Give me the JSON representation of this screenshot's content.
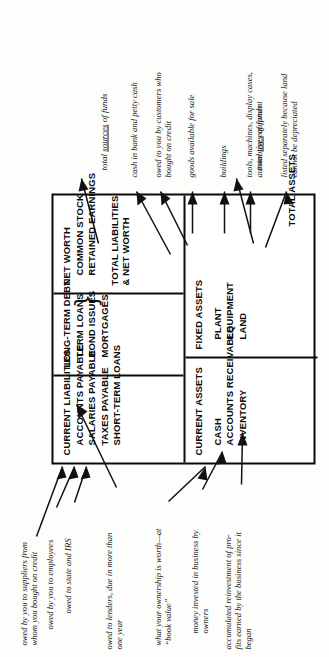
{
  "diagram": {
    "orientation": "rotated-90-ccw"
  },
  "liabilities_side": {
    "current_liabilities": {
      "heading": "CURRENT LIABILITIES",
      "items": [
        "ACCOUNTS PAYABLE",
        "SALARIES PAYABLE",
        "TAXES PAYABLE",
        "SHORT-TERM LOANS"
      ]
    },
    "long_term_debt": {
      "heading": "LONG-TERM DEBT",
      "items": [
        "TERM LOANS",
        "BOND ISSUES",
        "MORTGAGES"
      ],
      "brace": "}"
    },
    "net_worth": {
      "heading": "NET WORTH",
      "items": [
        "COMMON STOCK",
        "RETAINED EARNINGS"
      ],
      "total_line1": "TOTAL LIABILITIES",
      "total_line2": "& NET WORTH"
    },
    "total_label_pre": "total ",
    "total_label_underlined": "sources",
    "total_label_post": " of funds"
  },
  "assets_side": {
    "current_assets": {
      "heading": "CURRENT ASSETS",
      "items": [
        "CASH",
        "ACCOUNTS RECEIVABLE",
        "INVENTORY"
      ]
    },
    "fixed_assets": {
      "heading": "FIXED ASSETS",
      "items": [
        "PLANT",
        "EQUIPMENT",
        "LAND"
      ]
    },
    "total": "TOTAL ASSETS",
    "total_label_pre": "total ",
    "total_label_underlined": "uses",
    "total_label_post": " of funds"
  },
  "annotations": {
    "accounts_payable": "owed by you to suppliers from\nwhom you bought on credit",
    "salaries_payable": "owed by you to employees",
    "taxes_payable": "owed to state and IRS",
    "long_term_debt": "owed to lenders, due in more than\none year",
    "net_worth": "what your ownership is worth—at\n“book value”",
    "common_stock": "money invested in business by\nowners",
    "retained_earnings": "accumulated reinvestment of pro-\nfits earned by the business since it\nbegan",
    "cash": "cash in bank and petty cash",
    "accounts_receivable": "owed to you by customers who\nbought on credit",
    "inventory": "goods available for sale",
    "plant": "buildings",
    "equipment": "tools, machines, display cases,\nautomotive equipment",
    "land": "listed separately because land\ncannot be depreciated"
  },
  "colors": {
    "ink": "#0a0a0a",
    "paper": "#fdfdfc"
  }
}
